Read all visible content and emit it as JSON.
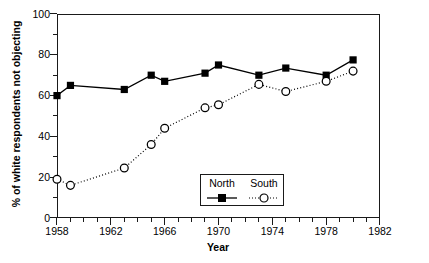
{
  "chart_data": {
    "type": "line",
    "title": "",
    "xlabel": "Year",
    "ylabel": "% of white respondents not objecting",
    "xlim": [
      1958,
      1982
    ],
    "ylim": [
      0,
      100
    ],
    "xticks": [
      1958,
      1962,
      1966,
      1970,
      1974,
      1978,
      1982
    ],
    "yticks": [
      0,
      20,
      40,
      60,
      80,
      100
    ],
    "xtick_labels": [
      "1958",
      "1962",
      "1966",
      "1970",
      "1974",
      "1978",
      "1982"
    ],
    "ytick_labels": [
      "0",
      "20",
      "40",
      "60",
      "80",
      "100"
    ],
    "x_minor_interval": 1,
    "y_minor_interval": 10,
    "grid": false,
    "legend_position": "lower-center",
    "series": [
      {
        "name": "North",
        "marker": "filled-square",
        "linestyle": "solid",
        "color": "#000000",
        "x": [
          1958,
          1959,
          1963,
          1965,
          1966,
          1969,
          1970,
          1973,
          1975,
          1978,
          1980
        ],
        "values": [
          60,
          65,
          63,
          70,
          67,
          71,
          75,
          70,
          73.5,
          70,
          77.5
        ]
      },
      {
        "name": "South",
        "marker": "open-circle",
        "linestyle": "dotted",
        "color": "#000000",
        "x": [
          1958,
          1959,
          1963,
          1965,
          1966,
          1969,
          1970,
          1973,
          1975,
          1978,
          1980
        ],
        "values": [
          19,
          16,
          24.5,
          36,
          44,
          54,
          55.5,
          65.5,
          62,
          67,
          72
        ]
      }
    ]
  },
  "legend": {
    "entries": [
      {
        "label": "North"
      },
      {
        "label": "South"
      }
    ]
  },
  "axes": {
    "x_title": "Year",
    "y_title": "% of white respondents not objecting"
  }
}
